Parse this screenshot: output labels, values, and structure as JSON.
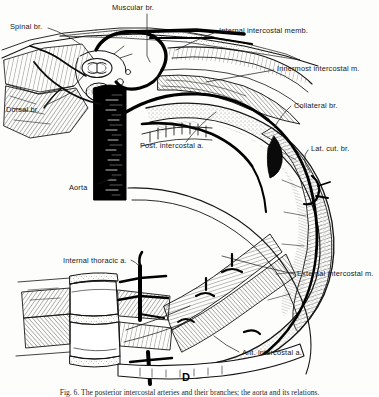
{
  "figure": {
    "panel_letter": "D",
    "caption_partial": "Fig. 6. The posterior intercostal arteries and their branches; the aorta and its relations.",
    "ink_color": "#111111",
    "background_color": "#fdfdfb"
  },
  "labels": [
    {
      "id": "spinal-br",
      "text": "Spinal br.",
      "x": 10,
      "y": 25,
      "align": "left"
    },
    {
      "id": "muscular-br",
      "text": "Muscular br.",
      "x": 112,
      "y": 6,
      "align": "left"
    },
    {
      "id": "internal-intercostal-memb",
      "text": "Internal intercostal memb.",
      "x": 219,
      "y": 29,
      "align": "left"
    },
    {
      "id": "innermost-intercostal-m",
      "text": "Innermost intercostal m.",
      "x": 277,
      "y": 67,
      "align": "left"
    },
    {
      "id": "dorsal-br",
      "text": "Dorsal br.",
      "x": 8,
      "y": 108,
      "align": "left"
    },
    {
      "id": "collateral-br",
      "text": "Collateral br.",
      "x": 294,
      "y": 104,
      "align": "left"
    },
    {
      "id": "post-intercostal-a",
      "text": "Post. intercostal a.",
      "x": 140,
      "y": 144,
      "align": "left"
    },
    {
      "id": "lat-cut-br",
      "text": "Lat. cut. br.",
      "x": 311,
      "y": 147,
      "align": "left"
    },
    {
      "id": "aorta",
      "text": "Aorta",
      "x": 71,
      "y": 186,
      "align": "left"
    },
    {
      "id": "internal-thoracic-a",
      "text": "Internal thoracic a.",
      "x": 65,
      "y": 259,
      "align": "left"
    },
    {
      "id": "external-intercostal-m",
      "text": "External intercostal m.",
      "x": 297,
      "y": 272,
      "align": "left"
    },
    {
      "id": "ant-intercostal-a",
      "text": "Ant. intercostal a.",
      "x": 242,
      "y": 351,
      "align": "left"
    }
  ],
  "structures": {
    "aorta": "solid black vertical vessel trunk",
    "posterior_intercostal_artery": "dark arc following rib curvature",
    "internal_thoracic_artery": "vertical black vessel near sternum with segmental branches",
    "vertebral_bodies": "stacked vertebral bodies with intervertebral discs, lower left",
    "rib_arc": "long curving rib shaft with hatched intercostal muscle layers",
    "muscle_hatching": "fine parallel line engraving indicating muscle fiber direction"
  }
}
